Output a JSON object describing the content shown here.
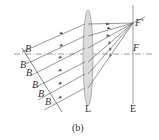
{
  "diagram": {
    "caption": "(b)",
    "labels": {
      "lens": "L",
      "screen": "E",
      "focal_point_image": "F′",
      "focal_point": "F",
      "wavefront_main": "B",
      "wavefront_1": "B",
      "wavefront_2": "B",
      "wavefront_3": "B",
      "wavefront_4": "B",
      "wavefront_5": "B"
    },
    "colors": {
      "line": "#555555",
      "lens_fill": "#d8d8d8",
      "axis": "#777777"
    }
  }
}
